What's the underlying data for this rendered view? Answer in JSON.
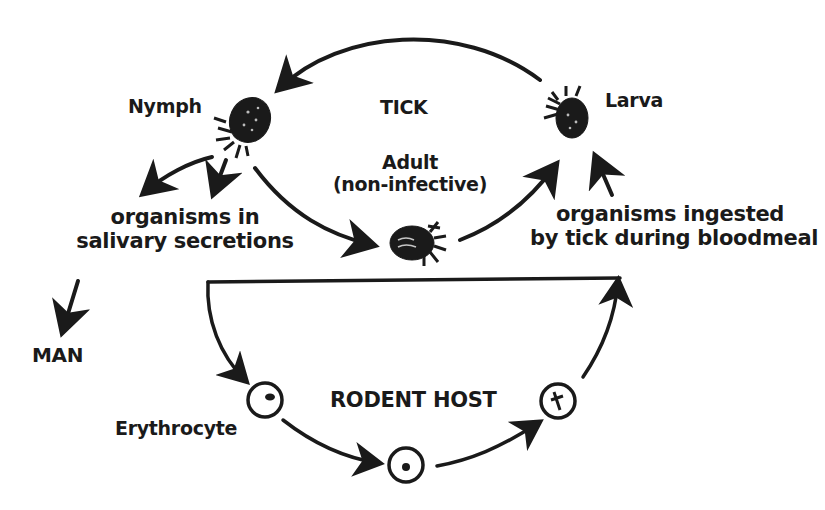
{
  "diagram": {
    "title": "TICK",
    "host_label": "RODENT HOST",
    "stages": {
      "nymph": "Nymph",
      "larva": "Larva",
      "adult_line1": "Adult",
      "adult_line2": "(non-infective)"
    },
    "notes": {
      "salivary_line1": "organisms in",
      "salivary_line2": "salivary secretions",
      "ingested_line1": "organisms ingested",
      "ingested_line2": "by tick during bloodmeal"
    },
    "man_label": "MAN",
    "erythrocyte_label": "Erythrocyte",
    "colors": {
      "ink": "#1a1a1a",
      "background": "#ffffff"
    }
  }
}
